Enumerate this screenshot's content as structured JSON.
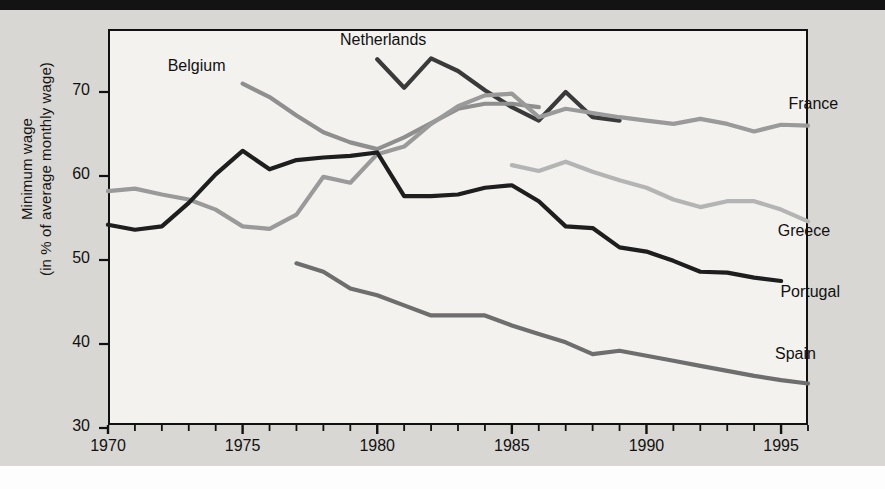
{
  "chart_data": {
    "type": "line",
    "title": "",
    "xlabel": "",
    "ylabel": "Minimum wage\n(in % of average monthly wage)",
    "ylabel_line1": "Minimum wage",
    "ylabel_line2": "(in % of average monthly wage)",
    "xlim": [
      1970,
      1996
    ],
    "ylim": [
      30,
      75
    ],
    "yticks": [
      30,
      40,
      50,
      60,
      70
    ],
    "xticks": [
      1970,
      1975,
      1980,
      1985,
      1990,
      1995
    ],
    "xtick_labels": [
      "1970",
      "1975",
      "1980",
      "1985",
      "1990",
      "1995"
    ],
    "ytick_labels": [
      "30",
      "40",
      "50",
      "60",
      "70"
    ],
    "grid": false,
    "legend_position": "inline-labels",
    "colors": {
      "netherlands": "#3a3a3a",
      "belgium": "#8f8f8f",
      "france": "#9a9a9a",
      "greece": "#b4b4b4",
      "portugal": "#1e1e1e",
      "spain": "#6e6e6e"
    },
    "series": [
      {
        "name": "Netherlands",
        "color": "#3a3a3a",
        "label_x": 1980.4,
        "label_y": 76.0,
        "x": [
          1980,
          1981,
          1982,
          1983,
          1984,
          1985,
          1986,
          1987,
          1988,
          1989
        ],
        "values": [
          73.9,
          70.5,
          74.0,
          72.5,
          70.2,
          68.2,
          66.6,
          70.0,
          67.0,
          66.6
        ]
      },
      {
        "name": "Belgium",
        "color": "#8f8f8f",
        "label_x": 1974.0,
        "label_y": 72.8,
        "x": [
          1975,
          1976,
          1977,
          1978,
          1979,
          1980,
          1981,
          1982,
          1983,
          1984,
          1985,
          1986
        ],
        "values": [
          71.0,
          69.4,
          67.2,
          65.2,
          64.0,
          63.2,
          64.6,
          66.3,
          68.0,
          68.6,
          68.6,
          68.2
        ]
      },
      {
        "name": "France",
        "color": "#9a9a9a",
        "label_x": 1995.2,
        "label_y": 68.3,
        "x": [
          1970,
          1971,
          1972,
          1973,
          1974,
          1975,
          1976,
          1977,
          1978,
          1979,
          1980,
          1981,
          1982,
          1983,
          1984,
          1985,
          1986,
          1987,
          1988,
          1989,
          1990,
          1991,
          1992,
          1993,
          1994,
          1995,
          1996
        ],
        "values": [
          58.2,
          58.5,
          57.8,
          57.2,
          56.0,
          54.0,
          53.7,
          55.4,
          59.9,
          59.2,
          62.6,
          63.5,
          66.2,
          68.3,
          69.6,
          69.8,
          67.0,
          68.0,
          67.5,
          67.0,
          66.6,
          66.2,
          66.8,
          66.2,
          65.3,
          66.1,
          66.0
        ]
      },
      {
        "name": "Greece",
        "color": "#b4b4b4",
        "label_x": 1994.8,
        "label_y": 53.2,
        "x": [
          1985,
          1986,
          1987,
          1988,
          1989,
          1990,
          1991,
          1992,
          1993,
          1994,
          1995,
          1996
        ],
        "values": [
          61.3,
          60.6,
          61.7,
          60.5,
          59.5,
          58.6,
          57.2,
          56.3,
          57.0,
          57.0,
          56.0,
          54.6
        ]
      },
      {
        "name": "Portugal",
        "color": "#1e1e1e",
        "label_x": 1994.9,
        "label_y": 46.0,
        "x": [
          1970,
          1971,
          1972,
          1973,
          1974,
          1975,
          1976,
          1977,
          1978,
          1979,
          1980,
          1981,
          1982,
          1983,
          1984,
          1985,
          1986,
          1987,
          1988,
          1989,
          1990,
          1991,
          1992,
          1993,
          1994,
          1995
        ],
        "values": [
          54.2,
          53.6,
          54.0,
          56.8,
          60.2,
          63.0,
          60.8,
          61.9,
          62.2,
          62.4,
          62.8,
          57.6,
          57.6,
          57.8,
          58.6,
          58.9,
          57.0,
          54.0,
          53.8,
          51.5,
          51.0,
          49.9,
          48.6,
          48.5,
          47.9,
          47.5
        ]
      },
      {
        "name": "Spain",
        "color": "#6e6e6e",
        "label_x": 1994.7,
        "label_y": 38.6,
        "x": [
          1977,
          1978,
          1979,
          1980,
          1981,
          1982,
          1983,
          1984,
          1985,
          1986,
          1987,
          1988,
          1989,
          1990,
          1991,
          1992,
          1993,
          1994,
          1995,
          1996
        ],
        "values": [
          49.6,
          48.6,
          46.6,
          45.8,
          44.6,
          43.4,
          43.4,
          43.4,
          42.2,
          41.2,
          40.2,
          38.8,
          39.2,
          38.6,
          38.0,
          37.4,
          36.8,
          36.2,
          35.7,
          35.3
        ]
      }
    ]
  },
  "axis": {
    "ylabel_line1": "Minimum wage",
    "ylabel_line2": "(in % of average monthly wage)"
  },
  "labels": {
    "netherlands": "Netherlands",
    "belgium": "Belgium",
    "france": "France",
    "greece": "Greece",
    "portugal": "Portugal",
    "spain": "Spain"
  },
  "yticks": [
    "70",
    "60",
    "50",
    "40",
    "30"
  ],
  "xticks": [
    "1970",
    "1975",
    "1980",
    "1985",
    "1990",
    "1995"
  ]
}
